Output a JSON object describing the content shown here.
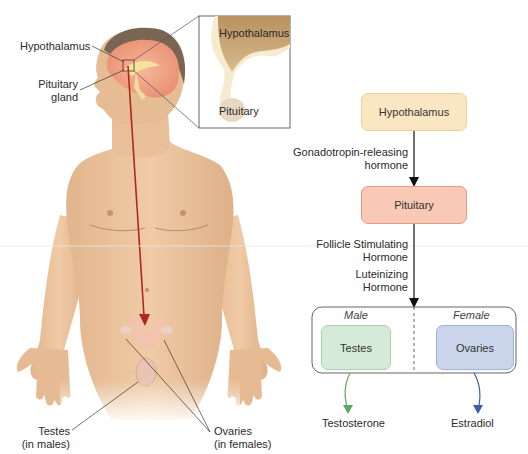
{
  "anatomy": {
    "labels": {
      "hypothalamus": "Hypothalamus",
      "pituitary_line1": "Pituitary",
      "pituitary_line2": "gland",
      "testes_line1": "Testes",
      "testes_line2": "(in males)",
      "ovaries_line1": "Ovaries",
      "ovaries_line2": "(in females)"
    },
    "inset": {
      "top_label": "Hypothalamus",
      "bottom_label": "Pituitary"
    }
  },
  "flowchart": {
    "nodes": {
      "hypothalamus": "Hypothalamus",
      "pituitary": "Pituitary",
      "testes": "Testes",
      "ovaries": "Ovaries"
    },
    "edges": {
      "gnrh_line1": "Gonadotropin-releasing",
      "gnrh_line2": "hormone",
      "fsh_line1": "Follicle Stimulating",
      "fsh_line2": "Hormone",
      "lh_line1": "Luteinizing",
      "lh_line2": "Hormone"
    },
    "groups": {
      "male": "Male",
      "female": "Female"
    },
    "outputs": {
      "male": "Testosterone",
      "female": "Estradiol"
    },
    "colors": {
      "hypothalamus_fill": "#fbe6c3",
      "hypothalamus_border": "#f0cf96",
      "pituitary_fill": "#f8c9b4",
      "pituitary_border": "#e79a82",
      "testes_fill": "#d5ebd7",
      "testes_border": "#a9cfae",
      "ovaries_fill": "#cad5ec",
      "ovaries_border": "#9fb0d6",
      "testosterone_arrow": "#5fa862",
      "estradiol_arrow": "#3d5fa8",
      "signal_arrow": "#b3261e"
    }
  }
}
